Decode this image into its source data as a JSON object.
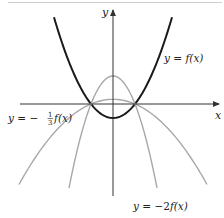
{
  "figure": {
    "type": "function-transformation-graph",
    "axes": {
      "x_label": "x",
      "y_label": "y",
      "origin_px": [
        113,
        104
      ],
      "x_range_px": [
        20,
        219
      ],
      "y_range_px": [
        196,
        10
      ],
      "axis_color": "#333333"
    },
    "curves": [
      {
        "id": "f",
        "label": "y = f(x)",
        "label_parts": {
          "lhs": "y",
          "eq": " = ",
          "rhs": "f(x)"
        },
        "scale": 1,
        "color": "#1a1a1a",
        "stroke_width": 2,
        "dx_range": [
          -59,
          59
        ],
        "label_pos_px": [
          164,
          62
        ]
      },
      {
        "id": "neg_one_third_f",
        "label": "y = −⅓f(x)",
        "label_parts": {
          "lhs": "y",
          "eq": " = −",
          "frac_num": "1",
          "frac_den": "3",
          "rhs": "f(x)"
        },
        "scale": -0.3333,
        "color": "#a8a8a8",
        "stroke_width": 1.4,
        "dx_range": [
          -94,
          94
        ],
        "label_pos_px": [
          8,
          122
        ]
      },
      {
        "id": "neg_two_f",
        "label": "y = −2f(x)",
        "label_parts": {
          "lhs": "y",
          "eq": " = −2",
          "rhs": "f(x)"
        },
        "scale": -2,
        "color": "#a8a8a8",
        "stroke_width": 1.4,
        "dx_range": [
          -44,
          44
        ],
        "label_pos_px": [
          133,
          210
        ]
      }
    ],
    "base_function_model": {
      "roots_dx_px": [
        -22,
        22
      ],
      "vertex_offset_px": 14
    }
  }
}
